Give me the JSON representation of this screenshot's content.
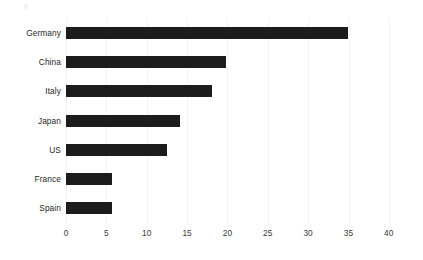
{
  "chart_data": {
    "type": "bar",
    "orientation": "horizontal",
    "title": "",
    "subtitle": "",
    "xlabel": "",
    "ylabel": "",
    "categories": [
      "Germany",
      "China",
      "Italy",
      "Japan",
      "US",
      "France",
      "Spain"
    ],
    "values": [
      35.0,
      19.8,
      18.1,
      14.1,
      12.5,
      5.7,
      5.7
    ],
    "xlim": [
      0,
      40
    ],
    "xticks": [
      0,
      5,
      10,
      15,
      20,
      25,
      30,
      35,
      40
    ],
    "xtick_labels": [
      "0",
      "5",
      "10",
      "15",
      "20",
      "25",
      "30",
      "35",
      "40"
    ],
    "grid": "vertical",
    "legend": "none",
    "bar_color": "#1c1c1c",
    "background_color": "#ffffff",
    "gridline_color": "#f2f2f2",
    "label_color": "#262626"
  }
}
